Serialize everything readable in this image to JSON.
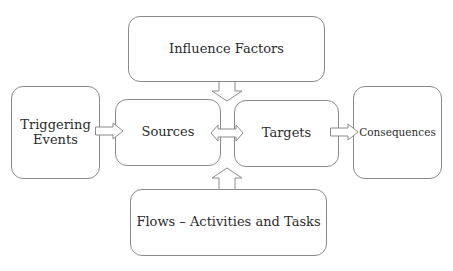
{
  "diagram": {
    "nodes": {
      "influence_factors": "Influence Factors",
      "triggering_events_line1": "Triggering",
      "triggering_events_line2": "Events",
      "sources": "Sources",
      "targets": "Targets",
      "consequences": "Consequences",
      "flows": "Flows – Activities and Tasks"
    },
    "edges": [
      {
        "from": "Triggering Events",
        "to": "Sources",
        "type": "block-arrow-right"
      },
      {
        "from": "Influence Factors",
        "to": "Sources/Targets",
        "type": "block-arrow-down"
      },
      {
        "from": "Sources",
        "to": "Targets",
        "type": "block-arrow-bidirectional"
      },
      {
        "from": "Flows – Activities and Tasks",
        "to": "Sources/Targets",
        "type": "block-arrow-up"
      },
      {
        "from": "Targets",
        "to": "Consequences",
        "type": "block-arrow-right"
      }
    ],
    "colors": {
      "border": "#8a8a8a",
      "text": "#2b2b2b",
      "background": "#ffffff"
    }
  }
}
